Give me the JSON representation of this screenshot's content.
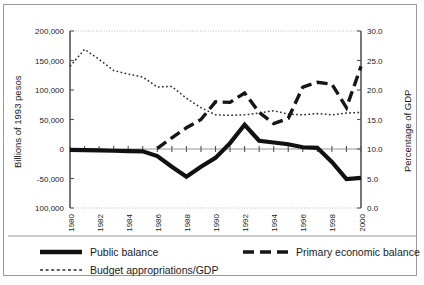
{
  "figure": {
    "background_color": "#ffffff",
    "frame_color": "#9a9a9a"
  },
  "chart_data": {
    "type": "line",
    "title": "",
    "xlabel": "",
    "ylabel": "Billions of 1993 pesos",
    "y2label": "Percentage of GDP",
    "x": [
      1980,
      1981,
      1982,
      1983,
      1984,
      1985,
      1986,
      1987,
      1988,
      1989,
      1990,
      1991,
      1992,
      1993,
      1994,
      1995,
      1996,
      1997,
      1998,
      1999,
      2000
    ],
    "xlim": [
      1980,
      2000
    ],
    "ylim": [
      -100000,
      200000
    ],
    "y2lim": [
      0.0,
      30.0
    ],
    "xticks": [
      1980,
      1982,
      1984,
      1986,
      1988,
      1990,
      1992,
      1994,
      1996,
      1998,
      2000
    ],
    "xtick_labels": [
      "1980",
      "1982",
      "1984",
      "1986",
      "1988",
      "1990",
      "1992",
      "1994",
      "1996",
      "1998",
      "2000"
    ],
    "yticks": [
      200000,
      150000,
      100000,
      50000,
      0,
      -50000,
      -100000
    ],
    "ytick_labels": [
      "200,000",
      "150,000",
      "100,000",
      "50,000",
      "0",
      "-50,000",
      "100,000"
    ],
    "y2ticks": [
      30.0,
      25.0,
      20.0,
      15.0,
      10.0,
      5.0,
      0.0
    ],
    "y2tick_labels": [
      "30.0",
      "25.0",
      "20.0",
      "15.0",
      "10.0",
      "5.0",
      "0.0"
    ],
    "grid": false,
    "legend_position": "bottom",
    "series": [
      {
        "name": "Public balance",
        "axis": "left",
        "style": "solid-thick",
        "color": "#111111",
        "values": [
          -1500,
          -2000,
          -2500,
          -3000,
          -3500,
          -4000,
          -12000,
          -30000,
          -47000,
          -30000,
          -15000,
          10000,
          41000,
          14000,
          11000,
          8000,
          3000,
          2000,
          -22000,
          -51000,
          -49000
        ]
      },
      {
        "name": "Primary economic balance",
        "axis": "left",
        "style": "dashed-thick",
        "color": "#161616",
        "values": [
          null,
          null,
          null,
          null,
          null,
          null,
          1000,
          19000,
          36000,
          50000,
          80000,
          79000,
          95000,
          62000,
          43000,
          52000,
          105000,
          113000,
          110000,
          70000,
          140000
        ]
      },
      {
        "name": "Budget appropriations/GDP",
        "axis": "right",
        "style": "dotted-thin",
        "color": "#2b2b2b",
        "values": [
          24.0,
          26.9,
          25.2,
          23.3,
          22.7,
          22.2,
          20.5,
          20.6,
          18.6,
          17.0,
          15.8,
          15.7,
          15.8,
          16.1,
          16.5,
          15.9,
          15.8,
          16.0,
          15.8,
          16.1,
          16.2
        ]
      }
    ]
  },
  "legend": {
    "items": [
      {
        "label": "Public balance",
        "swatch": "solid-thick"
      },
      {
        "label": "Primary economic balance",
        "swatch": "dashed-thick"
      },
      {
        "label": "Budget appropriations/GDP",
        "swatch": "dotted-thin"
      }
    ]
  }
}
